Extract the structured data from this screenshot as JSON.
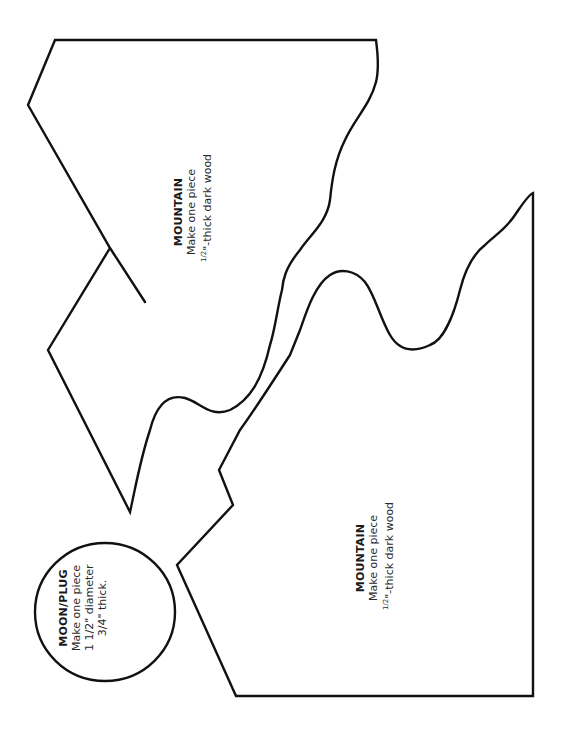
{
  "pieces": [
    {
      "id": "mountain-upper",
      "title": "MOUNTAIN",
      "line1": "Make one piece",
      "line2_frac": "1/2",
      "line2_rest": "\"-thick dark wood"
    },
    {
      "id": "mountain-lower",
      "title": "MOUNTAIN",
      "line1": "Make one piece",
      "line2_frac": "1/2",
      "line2_rest": "\"-thick dark wood"
    },
    {
      "id": "moon-plug",
      "title": "MOON/PLUG",
      "line1": "Make one piece",
      "line2": "1 1/2\" diameter",
      "line3": "3/4\" thick."
    }
  ],
  "colors": {
    "stroke": "#111111",
    "background": "#ffffff",
    "text": "#1a1a1a"
  }
}
